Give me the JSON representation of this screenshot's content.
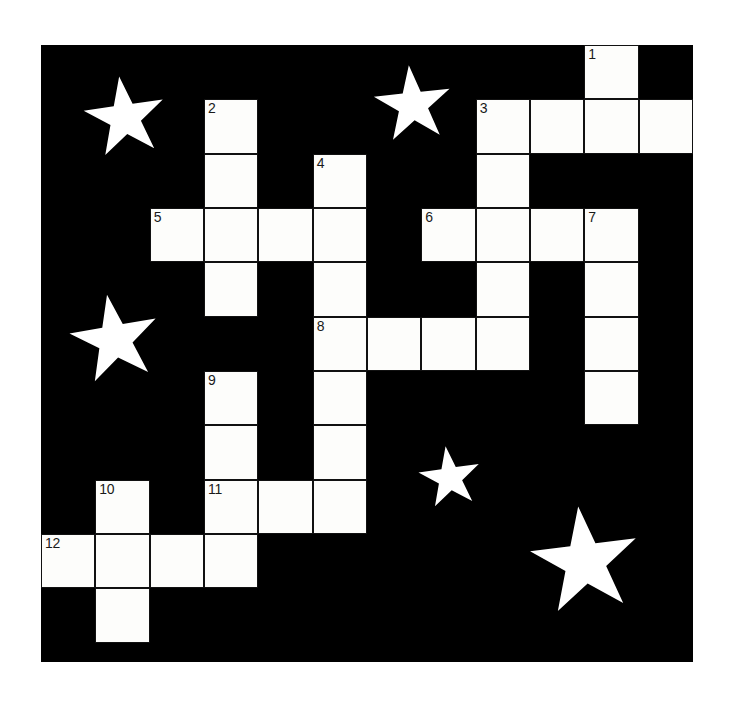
{
  "puzzle": {
    "title": "Crossword Grid",
    "grid": {
      "columns": 12,
      "rows": 11,
      "cell_size": 54.33,
      "origin_x": 41,
      "origin_y": 45,
      "width": 652,
      "height": 617,
      "background_color": "#000000",
      "cell_color": "#fdfdfb",
      "border_color": "#111111",
      "number_color": "#1a1a1a"
    },
    "cells": [
      {
        "row": 0,
        "col": 10,
        "number": "1"
      },
      {
        "row": 1,
        "col": 3,
        "number": "2"
      },
      {
        "row": 1,
        "col": 8,
        "number": "3"
      },
      {
        "row": 1,
        "col": 9,
        "number": ""
      },
      {
        "row": 1,
        "col": 10,
        "number": ""
      },
      {
        "row": 1,
        "col": 11,
        "number": ""
      },
      {
        "row": 2,
        "col": 3,
        "number": ""
      },
      {
        "row": 2,
        "col": 5,
        "number": "4"
      },
      {
        "row": 2,
        "col": 8,
        "number": ""
      },
      {
        "row": 3,
        "col": 2,
        "number": "5"
      },
      {
        "row": 3,
        "col": 3,
        "number": ""
      },
      {
        "row": 3,
        "col": 4,
        "number": ""
      },
      {
        "row": 3,
        "col": 5,
        "number": ""
      },
      {
        "row": 3,
        "col": 7,
        "number": "6"
      },
      {
        "row": 3,
        "col": 8,
        "number": ""
      },
      {
        "row": 3,
        "col": 9,
        "number": ""
      },
      {
        "row": 3,
        "col": 10,
        "number": "7"
      },
      {
        "row": 4,
        "col": 3,
        "number": ""
      },
      {
        "row": 4,
        "col": 5,
        "number": ""
      },
      {
        "row": 4,
        "col": 8,
        "number": ""
      },
      {
        "row": 4,
        "col": 10,
        "number": ""
      },
      {
        "row": 5,
        "col": 5,
        "number": "8"
      },
      {
        "row": 5,
        "col": 6,
        "number": ""
      },
      {
        "row": 5,
        "col": 7,
        "number": ""
      },
      {
        "row": 5,
        "col": 8,
        "number": ""
      },
      {
        "row": 5,
        "col": 10,
        "number": ""
      },
      {
        "row": 6,
        "col": 3,
        "number": "9"
      },
      {
        "row": 6,
        "col": 5,
        "number": ""
      },
      {
        "row": 6,
        "col": 10,
        "number": ""
      },
      {
        "row": 7,
        "col": 3,
        "number": ""
      },
      {
        "row": 7,
        "col": 5,
        "number": ""
      },
      {
        "row": 8,
        "col": 1,
        "number": "10"
      },
      {
        "row": 8,
        "col": 3,
        "number": "11"
      },
      {
        "row": 8,
        "col": 4,
        "number": ""
      },
      {
        "row": 8,
        "col": 5,
        "number": ""
      },
      {
        "row": 9,
        "col": 0,
        "number": "12"
      },
      {
        "row": 9,
        "col": 1,
        "number": ""
      },
      {
        "row": 9,
        "col": 2,
        "number": ""
      },
      {
        "row": 9,
        "col": 3,
        "number": ""
      },
      {
        "row": 10,
        "col": 1,
        "number": ""
      }
    ],
    "stars": [
      {
        "name": "star-top-left",
        "cx": 84,
        "cy": 73,
        "radius": 42,
        "rotation": -8
      },
      {
        "name": "star-top-center",
        "cx": 372,
        "cy": 60,
        "radius": 40,
        "rotation": -6
      },
      {
        "name": "star-middle-left",
        "cx": 74,
        "cy": 295,
        "radius": 46,
        "rotation": -10
      },
      {
        "name": "star-lower-center",
        "cx": 409,
        "cy": 433,
        "radius": 32,
        "rotation": -8
      },
      {
        "name": "star-bottom-right",
        "cx": 544,
        "cy": 517,
        "radius": 56,
        "rotation": -7
      }
    ],
    "star_color": "#ffffff"
  }
}
